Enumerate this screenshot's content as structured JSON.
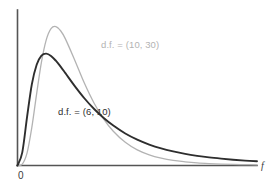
{
  "chart_data": {
    "type": "line",
    "title": "",
    "subtitle": "",
    "xlabel": "f",
    "ylabel": "",
    "grid": false,
    "legend_position": "inline-annotation",
    "xlim": [
      0,
      5.0
    ],
    "ylim": [
      0,
      0.85
    ],
    "axes": {
      "origin_label": "0",
      "x_axis_variable": "f",
      "x_axis_shown": true,
      "y_axis_shown": true,
      "x_ticks": [],
      "y_ticks": []
    },
    "annotations": [
      {
        "name": "label-df-10-30",
        "text": "d.f. = (10, 30)",
        "color": "#b3b3b3",
        "x": 1.7,
        "y": 0.63
      },
      {
        "name": "label-df-6-10",
        "text": "d.f. = (6, 10)",
        "color": "#2e2e2e",
        "x": 0.85,
        "y": 0.3
      }
    ],
    "series": [
      {
        "name": "d.f. = (10, 30)",
        "color": "#b3b3b3",
        "df1": 10,
        "df2": 30,
        "peak_x": 0.79,
        "peak_y": 0.79,
        "x": [
          0.0,
          0.1,
          0.2,
          0.3,
          0.4,
          0.5,
          0.6,
          0.7,
          0.8,
          0.9,
          1.0,
          1.2,
          1.4,
          1.6,
          1.8,
          2.0,
          2.25,
          2.5,
          2.75,
          3.0,
          3.25,
          3.5,
          3.75,
          4.0,
          4.25,
          4.5,
          4.75,
          5.0
        ],
        "y": [
          0.0,
          0.008,
          0.072,
          0.218,
          0.409,
          0.588,
          0.714,
          0.778,
          0.79,
          0.766,
          0.72,
          0.596,
          0.466,
          0.354,
          0.264,
          0.195,
          0.132,
          0.089,
          0.061,
          0.042,
          0.029,
          0.021,
          0.015,
          0.011,
          0.008,
          0.006,
          0.005,
          0.004
        ]
      },
      {
        "name": "d.f. = (6, 10)",
        "color": "#2e2e2e",
        "df1": 6,
        "df2": 10,
        "peak_x": 0.56,
        "peak_y": 0.63,
        "x": [
          0.0,
          0.1,
          0.2,
          0.3,
          0.4,
          0.5,
          0.6,
          0.7,
          0.8,
          0.9,
          1.0,
          1.2,
          1.4,
          1.6,
          1.8,
          2.0,
          2.25,
          2.5,
          2.75,
          3.0,
          3.25,
          3.5,
          3.75,
          4.0,
          4.25,
          4.5,
          4.75,
          5.0
        ],
        "y": [
          0.0,
          0.075,
          0.276,
          0.463,
          0.573,
          0.625,
          0.636,
          0.623,
          0.596,
          0.562,
          0.525,
          0.45,
          0.381,
          0.321,
          0.27,
          0.227,
          0.182,
          0.147,
          0.119,
          0.097,
          0.08,
          0.066,
          0.055,
          0.046,
          0.039,
          0.033,
          0.028,
          0.024
        ]
      }
    ]
  }
}
